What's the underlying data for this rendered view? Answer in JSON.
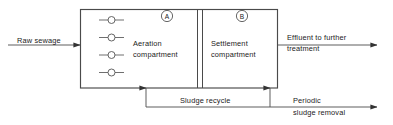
{
  "diagram": {
    "type": "process-flow",
    "line_color": "#555555",
    "text_color": "#1a1a1a",
    "background": "#ffffff",
    "vessel": {
      "compartments": [
        {
          "marker": "A",
          "name_line1": "Aeration",
          "name_line2": "compartment",
          "aerator_count": 4,
          "aerator_icon": "aerator-circle-icon"
        },
        {
          "marker": "B",
          "name_line1": "Settlement",
          "name_line2": "compartment",
          "aerator_count": 0
        }
      ]
    },
    "flows": {
      "inlet": {
        "label": "Raw sewage",
        "direction": "right",
        "icon": "arrow-right-icon"
      },
      "outlet": {
        "label_line1": "Effluent to further",
        "label_line2": "treatment",
        "direction": "right",
        "icon": "arrow-right-icon"
      },
      "recycle": {
        "label": "Sludge recycle",
        "direction": "left",
        "icon": "arrow-down-icon"
      },
      "removal": {
        "label_line1": "Periodic",
        "label_line2": "sludge removal",
        "direction": "right",
        "icon": "arrow-right-icon"
      }
    }
  }
}
